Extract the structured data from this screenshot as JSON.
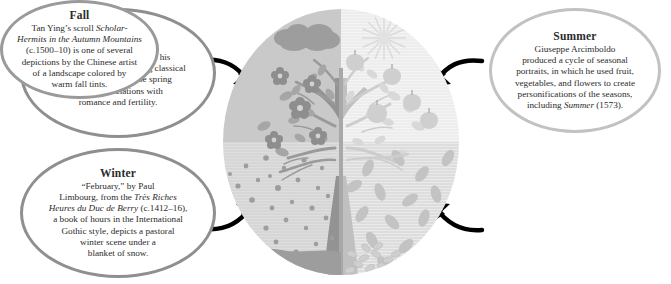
{
  "diagram": {
    "center_illustration": {
      "name": "four-season-tree-circle",
      "description": "Circular illustration of a single tree divided into four quadrants, one per season",
      "quadrants": [
        {
          "position": "top-left",
          "season": "Spring",
          "motifs": [
            "blossoms",
            "leaves",
            "clouds"
          ],
          "bg_color": "#c9c9c9"
        },
        {
          "position": "top-right",
          "season": "Summer",
          "motifs": [
            "fruit",
            "full leaves",
            "sun"
          ],
          "bg_color": "#ececec"
        },
        {
          "position": "bottom-left",
          "season": "Winter",
          "motifs": [
            "bare branches",
            "falling snow",
            "snow drift"
          ],
          "bg_color": "#d5d5d5"
        },
        {
          "position": "bottom-right",
          "season": "Fall",
          "motifs": [
            "falling leaves",
            "leaf pile"
          ],
          "bg_color": "#dcdcdc"
        }
      ],
      "tree_color_left": "#9a9a9a",
      "tree_color_right": "#c4c4c4"
    },
    "callouts": [
      {
        "id": "spring",
        "title": "Spring",
        "lines": [
          [
            {
              "t": "Sandro Botticelli painted his",
              "i": false
            }
          ],
          [
            {
              "t": "Primavera",
              "i": true
            },
            {
              "t": " (1477–82) using classical",
              "i": false
            }
          ],
          [
            {
              "t": "symbolism to describe spring",
              "i": false
            }
          ],
          [
            {
              "t": "and its associations with",
              "i": false
            }
          ],
          [
            {
              "t": "romance and fertility.",
              "i": false
            }
          ]
        ],
        "border_color": "#8f8f8f"
      },
      {
        "id": "summer",
        "title": "Summer",
        "lines": [
          [
            {
              "t": "Giuseppe Arcimboldo",
              "i": false
            }
          ],
          [
            {
              "t": "produced a cycle of seasonal",
              "i": false
            }
          ],
          [
            {
              "t": "portraits, in which he used fruit,",
              "i": false
            }
          ],
          [
            {
              "t": "vegetables, and flowers to create",
              "i": false
            }
          ],
          [
            {
              "t": "personifications of the seasons,",
              "i": false
            }
          ],
          [
            {
              "t": "including ",
              "i": false
            },
            {
              "t": "Summer",
              "i": true
            },
            {
              "t": " (1573).",
              "i": false
            }
          ]
        ],
        "border_color": "#c2c2c2"
      },
      {
        "id": "winter",
        "title": "Winter",
        "lines": [
          [
            {
              "t": "“February,” by Paul",
              "i": false
            }
          ],
          [
            {
              "t": "Limbourg, from the ",
              "i": false
            },
            {
              "t": "Très Riches",
              "i": true
            }
          ],
          [
            {
              "t": "Heures du Duc de Berry",
              "i": true
            },
            {
              "t": " (c.1412–16),",
              "i": false
            }
          ],
          [
            {
              "t": "a book of hours in the International",
              "i": false
            }
          ],
          [
            {
              "t": "Gothic style, depicts a pastoral",
              "i": false
            }
          ],
          [
            {
              "t": "winter scene under a",
              "i": false
            }
          ],
          [
            {
              "t": "blanket of snow.",
              "i": false
            }
          ]
        ],
        "border_color": "#8f8f8f"
      },
      {
        "id": "fall",
        "title": "Fall",
        "lines": [
          [
            {
              "t": "Tan Ying’s scroll ",
              "i": false
            },
            {
              "t": "Scholar-",
              "i": true
            }
          ],
          [
            {
              "t": "Hermits in the Autumn Mountains",
              "i": true
            }
          ],
          [
            {
              "t": "(c.1500–10) is one of several",
              "i": false
            }
          ],
          [
            {
              "t": "depictions by the Chinese artist",
              "i": false
            }
          ],
          [
            {
              "t": "of a landscape colored by",
              "i": false
            }
          ],
          [
            {
              "t": "warm fall tints.",
              "i": false
            }
          ]
        ],
        "border_color": "#9a9a9a"
      }
    ],
    "arrows": [
      {
        "name": "arrow-spring-to-circle",
        "from": "spring",
        "to": "top-left-quadrant",
        "direction": "down-right"
      },
      {
        "name": "arrow-summer-to-circle",
        "from": "summer",
        "to": "top-right-quadrant",
        "direction": "down-left"
      },
      {
        "name": "arrow-winter-to-circle",
        "from": "winter",
        "to": "bottom-left-quadrant",
        "direction": "up-right"
      },
      {
        "name": "arrow-fall-to-circle",
        "from": "fall",
        "to": "bottom-right-quadrant",
        "direction": "up-left"
      }
    ],
    "colors": {
      "arrow": "#000000",
      "text": "#2b2b2b",
      "background": "#ffffff"
    }
  }
}
